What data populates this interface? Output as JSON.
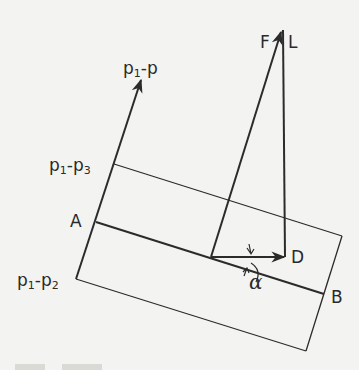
{
  "diagram": {
    "stroke_color": "#2b2b2b",
    "background": "#f3f3f1",
    "labels": {
      "p1_p": {
        "base": "p",
        "sub": "1",
        "rest": "-p"
      },
      "p1_p3": {
        "base": "p",
        "sub": "1",
        "rest": "-p",
        "sub2": "3"
      },
      "p1_p2": {
        "base": "p",
        "sub": "1",
        "rest": "-p",
        "sub2": "2"
      },
      "A": "A",
      "B": "B",
      "D": "D",
      "F": "F",
      "L": "L",
      "alpha": "α"
    },
    "points": {
      "axis_bottom": [
        76,
        279
      ],
      "axis_tip": [
        141,
        80
      ],
      "p1_p3_corner": [
        114,
        164
      ],
      "A": [
        96,
        222
      ],
      "top_right_corner": [
        342,
        236
      ],
      "bottom_right_corner": [
        306,
        351
      ],
      "B": [
        324,
        294
      ],
      "origin": [
        211,
        257
      ],
      "D": [
        285,
        257
      ],
      "FL_tip": [
        282,
        30
      ]
    }
  }
}
